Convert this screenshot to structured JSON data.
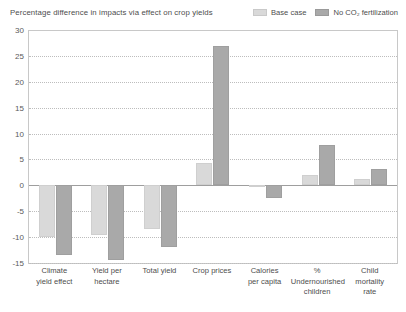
{
  "header": {
    "title": "Percentage difference in impacts via effect on crop yields"
  },
  "legend": {
    "items": [
      {
        "label": "Base case",
        "color": "#d9d9d9",
        "key": "base"
      },
      {
        "label": "No CO₂ fertilization",
        "color": "#a9a9a9",
        "key": "noco2"
      }
    ]
  },
  "chart_data": {
    "type": "bar",
    "title": "Percentage difference in impacts via effect on crop yields",
    "xlabel": "",
    "ylabel": "",
    "ylim": [
      -15,
      30
    ],
    "ytick_step": 5,
    "yticks": [
      "30",
      "25",
      "20",
      "15",
      "10",
      "5",
      "0",
      "-5",
      "-10",
      "-15"
    ],
    "ytick_values": [
      30,
      25,
      20,
      15,
      10,
      5,
      0,
      -5,
      -10,
      -15
    ],
    "grid": true,
    "legend_position": "top-right",
    "categories": [
      "Climate yield effect",
      "Yield per hectare",
      "Total yield",
      "Crop prices",
      "Calories per capita",
      "% Undernourished children",
      "Child mortality rate"
    ],
    "category_lines": [
      [
        "Climate",
        "yield effect"
      ],
      [
        "Yield per",
        "hectare"
      ],
      [
        "Total yield"
      ],
      [
        "Crop prices"
      ],
      [
        "Calories",
        "per capita"
      ],
      [
        "%",
        "Undernourished",
        "children"
      ],
      [
        "Child",
        "mortality",
        "rate"
      ]
    ],
    "series": [
      {
        "name": "Base case",
        "color": "#d9d9d9",
        "values": [
          -10.0,
          -9.5,
          -8.5,
          4.3,
          -0.3,
          2.0,
          1.2
        ]
      },
      {
        "name": "No CO₂ fertilization",
        "color": "#a9a9a9",
        "values": [
          -13.5,
          -14.5,
          -12.0,
          27.0,
          -2.5,
          7.7,
          3.2
        ]
      }
    ]
  }
}
